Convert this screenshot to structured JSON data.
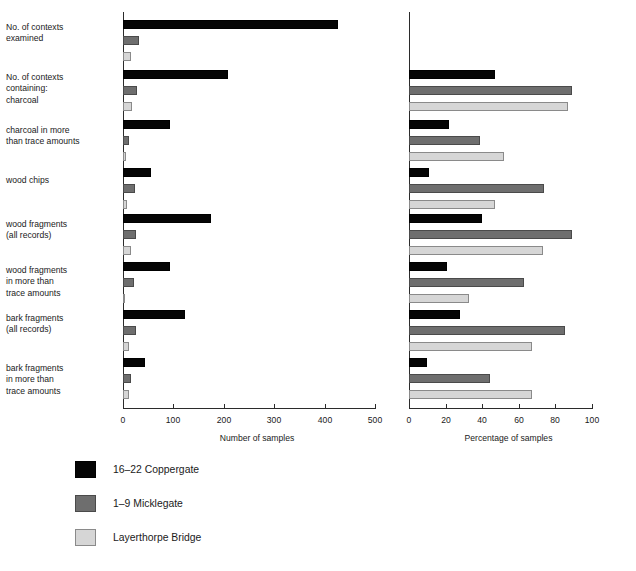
{
  "chart_data": {
    "type": "bar",
    "orientation": "horizontal",
    "title": "",
    "grid": false,
    "legend_position": "bottom-left",
    "categories": [
      "No. of contexts\nexamined",
      "No. of contexts\ncontaining:\ncharcoal",
      "charcoal in more\nthan trace amounts",
      "wood chips",
      "wood fragments\n(all records)",
      "wood fragments\nin more than\ntrace amounts",
      "bark fragments\n(all records)",
      "bark fragments\nin more than\ntrace amounts"
    ],
    "series_names": [
      "16–22 Coppergate",
      "1–9 Micklegate",
      "Layerthorpe Bridge"
    ],
    "series_colors": [
      "#050505",
      "#6e6e6e",
      "#d6d6d6"
    ],
    "panels": [
      {
        "id": "counts",
        "xlabel": "Number of samples",
        "xlim": [
          0,
          500
        ],
        "xticks": [
          0,
          100,
          200,
          300,
          400,
          500
        ],
        "xticklabels": [
          "0",
          "100",
          "200",
          "300",
          "400",
          "500"
        ],
        "series": [
          {
            "name": "16–22 Coppergate",
            "values": [
              426,
              208,
              93,
              56,
              175,
              93,
              123,
              44
            ]
          },
          {
            "name": "1–9 Micklegate",
            "values": [
              32,
              28,
              12,
              24,
              26,
              21,
              26,
              15
            ]
          },
          {
            "name": "Layerthorpe Bridge",
            "values": [
              16,
              18,
              6,
              8,
              15,
              4,
              12,
              12
            ]
          }
        ]
      },
      {
        "id": "percentages",
        "xlabel": "Percentage of samples",
        "xlim": [
          0,
          100
        ],
        "xticks": [
          0,
          20,
          40,
          60,
          80,
          100
        ],
        "xticklabels": [
          "0",
          "20",
          "40",
          "60",
          "80",
          "100"
        ],
        "series": [
          {
            "name": "16–22 Coppergate",
            "values": [
              null,
              47,
              22,
              11,
              40,
              21,
              28,
              10
            ]
          },
          {
            "name": "1–9 Micklegate",
            "values": [
              null,
              89,
              39,
              74,
              89,
              63,
              85,
              44
            ]
          },
          {
            "name": "Layerthorpe Bridge",
            "values": [
              null,
              87,
              52,
              47,
              73,
              33,
              67,
              67
            ]
          }
        ]
      }
    ]
  },
  "legend": {
    "items": [
      {
        "label": "16–22 Coppergate",
        "color": "#050505"
      },
      {
        "label": "1–9 Micklegate",
        "color": "#6e6e6e"
      },
      {
        "label": "Layerthorpe Bridge",
        "color": "#d6d6d6"
      }
    ]
  }
}
